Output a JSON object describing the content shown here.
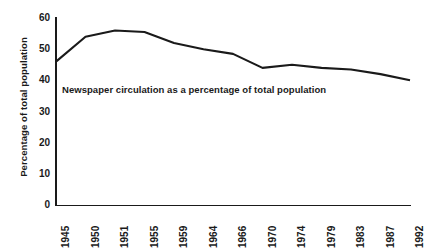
{
  "chart_data": {
    "type": "line",
    "title": "",
    "subtitle": "",
    "xlabel": "",
    "ylabel": "Percentage of total population",
    "annotation": "Newspaper circulation as a percentage of total population",
    "grid": false,
    "legend": false,
    "ylim": [
      0,
      60
    ],
    "y_ticks": [
      0,
      10,
      20,
      30,
      40,
      50,
      60
    ],
    "y_tick_labels": [
      "0",
      "10",
      "20",
      "30",
      "40",
      "50",
      "60"
    ],
    "categories": [
      "1945",
      "1950",
      "1951",
      "1955",
      "1959",
      "1964",
      "1966",
      "1970",
      "1974",
      "1979",
      "1983",
      "1987",
      "1992"
    ],
    "x_tick_labels": [
      "1945",
      "1950",
      "1951",
      "1955",
      "1959",
      "1964",
      "1966",
      "1970",
      "1974",
      "1979",
      "1983",
      "1987",
      "1992"
    ],
    "series": [
      {
        "name": "Newspaper circulation",
        "values": [
          46,
          54,
          56,
          55.5,
          52,
          50,
          48.5,
          44,
          45,
          44,
          43.5,
          42,
          40
        ]
      }
    ]
  },
  "axis": {
    "y_title": "Percentage of total population"
  },
  "layout": {
    "plot_left": 56,
    "plot_right": 410,
    "plot_top": 18,
    "plot_bottom": 205
  }
}
